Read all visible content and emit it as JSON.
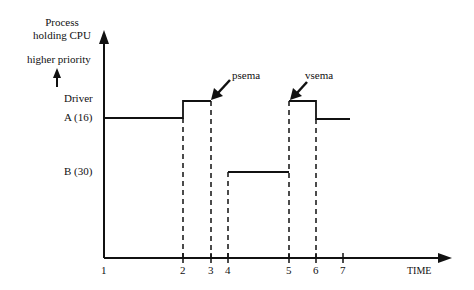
{
  "diagram": {
    "y_axis": {
      "title_line1": "Process",
      "title_line2": "holding CPU",
      "priority_label": "higher priority",
      "priority_arrow_icon": "up-arrow-icon"
    },
    "levels": [
      {
        "label_line1": "Driver",
        "label_line2": "A (16)"
      },
      {
        "label": "B (30)"
      }
    ],
    "x_axis": {
      "label": "TIME",
      "ticks": [
        "1",
        "2",
        "3",
        "4",
        "5",
        "6",
        "7"
      ]
    },
    "annotations": [
      {
        "label": "psema",
        "icon": "pointer-arrow-icon"
      },
      {
        "label": "vsema",
        "icon": "pointer-arrow-icon"
      }
    ]
  }
}
